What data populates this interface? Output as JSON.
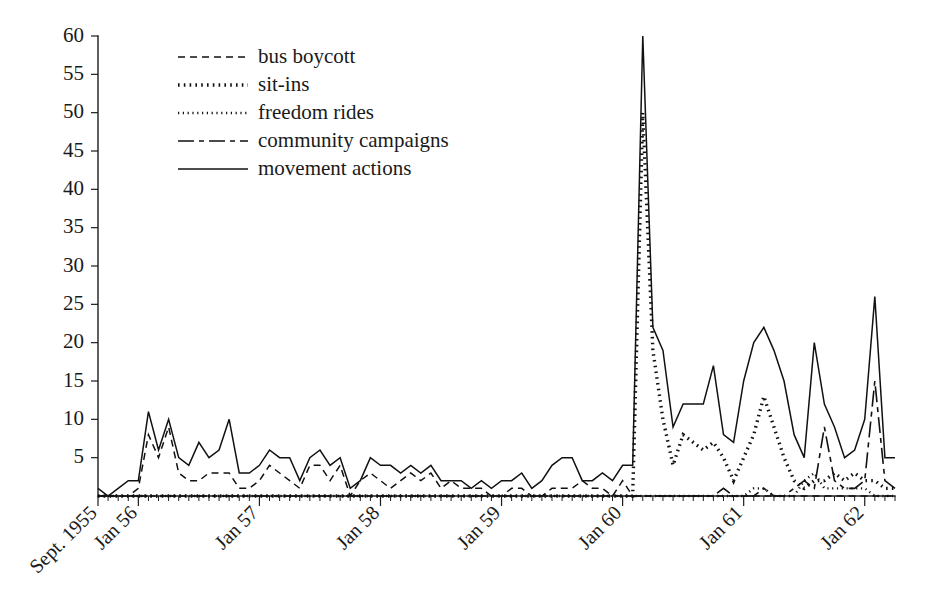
{
  "chart_data": {
    "type": "line",
    "title": "",
    "subtitle": "",
    "xlabel": "",
    "ylabel": "",
    "ylim": [
      0,
      60
    ],
    "xlim": [
      0,
      79
    ],
    "grid": false,
    "legend_position": "top-left",
    "y_ticks": [
      0,
      5,
      10,
      15,
      20,
      25,
      30,
      35,
      40,
      45,
      50,
      55,
      60
    ],
    "y_tick_labels": [
      "",
      "5",
      "10",
      "15",
      "20",
      "25",
      "30",
      "35",
      "40",
      "45",
      "50",
      "55",
      "60"
    ],
    "x_tick_labels": [
      "Sept. 1955",
      "Jan 56",
      "Jan 57",
      "Jan 58",
      "Jan 59",
      "Jan 60",
      "Jan 61",
      "Jan 62"
    ],
    "x_tick_indices": [
      0,
      4,
      16,
      28,
      40,
      52,
      64,
      76
    ],
    "x_start_month": "Sept. 1955",
    "x_months_total": 80,
    "series": [
      {
        "name": "bus boycott",
        "dash": "7,5",
        "width": 1.5,
        "values": [
          0,
          0,
          0,
          0,
          1,
          8,
          5,
          9,
          3,
          2,
          2,
          3,
          3,
          3,
          1,
          1,
          2,
          4,
          3,
          2,
          1,
          4,
          4,
          2,
          4,
          0,
          2,
          3,
          2,
          1,
          2,
          3,
          2,
          3,
          1,
          2,
          1,
          1,
          1,
          0,
          0,
          1,
          1,
          0,
          0,
          1,
          1,
          1,
          2,
          1,
          1,
          0,
          2,
          0,
          0,
          0,
          0,
          0,
          0,
          0,
          0,
          0,
          0,
          0,
          0,
          0,
          0,
          0,
          0,
          0,
          0,
          0,
          0,
          0,
          0,
          0,
          0,
          0,
          0,
          0
        ]
      },
      {
        "name": "sit-ins",
        "dash": "1.6,4.2",
        "width": 3.4,
        "values": [
          0,
          0,
          0,
          0,
          0,
          0,
          0,
          0,
          0,
          0,
          0,
          0,
          0,
          0,
          0,
          0,
          0,
          0,
          0,
          0,
          0,
          0,
          0,
          0,
          0,
          0,
          0,
          0,
          0,
          0,
          0,
          0,
          0,
          0,
          0,
          0,
          0,
          0,
          0,
          0,
          0,
          0,
          0,
          0,
          0,
          0,
          0,
          0,
          0,
          0,
          0,
          0,
          0,
          0,
          50,
          19,
          10,
          4,
          8,
          7,
          6,
          7,
          5,
          2,
          5,
          8,
          13,
          9,
          5,
          2,
          1,
          2,
          2,
          3,
          2,
          3,
          2,
          2,
          1,
          1
        ]
      },
      {
        "name": "freedom rides",
        "dash": "1.2,3.6",
        "width": 2.4,
        "values": [
          0,
          0,
          0,
          0,
          0,
          0,
          0,
          0,
          0,
          0,
          0,
          0,
          0,
          0,
          0,
          0,
          0,
          0,
          0,
          0,
          0,
          0,
          0,
          0,
          0,
          0,
          0,
          0,
          0,
          0,
          0,
          0,
          0,
          0,
          0,
          0,
          0,
          0,
          0,
          0,
          0,
          0,
          0,
          0,
          0,
          0,
          0,
          0,
          0,
          0,
          0,
          0,
          0,
          0,
          0,
          0,
          0,
          0,
          0,
          0,
          0,
          0,
          0,
          0,
          0,
          1,
          1,
          0,
          0,
          0,
          2,
          3,
          1,
          1,
          1,
          1,
          1,
          0,
          0,
          0
        ]
      },
      {
        "name": "community campaigns",
        "dash": "16,5,5,5",
        "width": 1.6,
        "values": [
          0,
          0,
          0,
          0,
          0,
          0,
          0,
          0,
          0,
          0,
          0,
          0,
          0,
          0,
          0,
          0,
          0,
          0,
          0,
          0,
          0,
          0,
          0,
          0,
          0,
          0,
          0,
          0,
          0,
          0,
          0,
          0,
          0,
          0,
          0,
          0,
          0,
          0,
          0,
          0,
          0,
          0,
          0,
          0,
          0,
          0,
          0,
          0,
          0,
          0,
          0,
          0,
          0,
          0,
          0,
          0,
          0,
          0,
          0,
          0,
          0,
          0,
          1,
          0,
          0,
          0,
          1,
          0,
          0,
          1,
          2,
          1,
          9,
          2,
          1,
          1,
          2,
          15,
          2,
          1
        ]
      },
      {
        "name": "movement actions",
        "dash": "",
        "width": 1.5,
        "values": [
          1,
          0,
          1,
          2,
          2,
          11,
          6,
          10,
          5,
          4,
          7,
          5,
          6,
          10,
          3,
          3,
          4,
          6,
          5,
          5,
          2,
          5,
          6,
          4,
          5,
          1,
          2,
          5,
          4,
          4,
          3,
          4,
          3,
          4,
          2,
          2,
          2,
          1,
          2,
          1,
          2,
          2,
          3,
          1,
          2,
          4,
          5,
          5,
          2,
          2,
          3,
          2,
          4,
          4,
          60,
          22,
          19,
          9,
          12,
          12,
          12,
          17,
          8,
          7,
          15,
          20,
          22,
          19,
          15,
          8,
          5,
          20,
          12,
          9,
          5,
          6,
          10,
          26,
          5,
          5
        ]
      }
    ],
    "legend_entries": [
      {
        "label": "bus boycott"
      },
      {
        "label": "sit-ins"
      },
      {
        "label": "freedom rides"
      },
      {
        "label": "community campaigns"
      },
      {
        "label": "movement actions"
      }
    ],
    "colors": {
      "ink": "#111111",
      "axis": "#1c1c1c",
      "background": "#ffffff"
    },
    "annotations": []
  }
}
